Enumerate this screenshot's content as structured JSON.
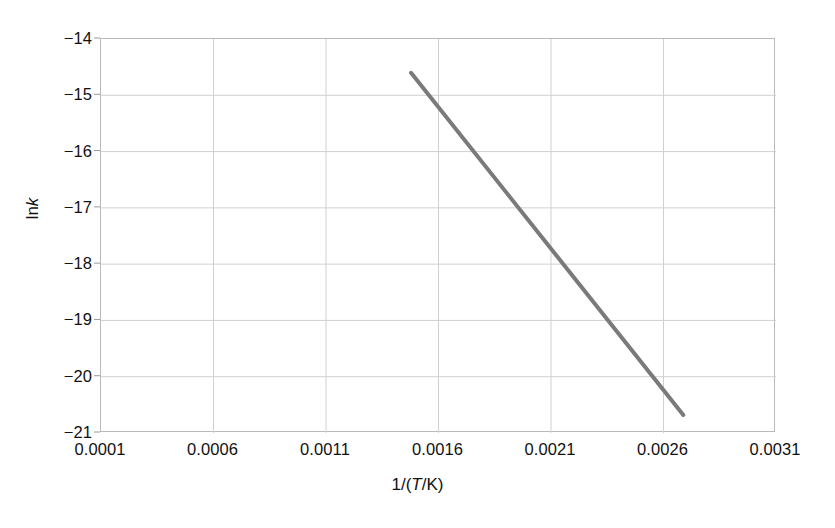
{
  "chart_data": {
    "type": "line",
    "title": "",
    "xlabel": "1/(T/K)",
    "ylabel": "lnk",
    "xlabel_parts": {
      "pre": "1/(",
      "italic": "T",
      "post": "/K)"
    },
    "ylabel_parts": {
      "pre": "ln",
      "italic": "k"
    },
    "xlim": [
      0.0001,
      0.0031
    ],
    "ylim": [
      -21,
      -14
    ],
    "xticks": [
      "0.0001",
      "0.0006",
      "0.0011",
      "0.0016",
      "0.0021",
      "0.0026",
      "0.0031"
    ],
    "xtick_values": [
      0.0001,
      0.0006,
      0.0011,
      0.0016,
      0.0021,
      0.0026,
      0.0031
    ],
    "yticks": [
      "−14",
      "−15",
      "−16",
      "−17",
      "−18",
      "−19",
      "−20",
      "−21"
    ],
    "ytick_values": [
      -14,
      -15,
      -16,
      -17,
      -18,
      -19,
      -20,
      -21
    ],
    "grid": true,
    "grid_color": "#d0d0d0",
    "legend": null,
    "series": [
      {
        "name": "Arrhenius fit",
        "color": "#7a7a7a",
        "line_width": 4,
        "x": [
          0.001478,
          0.002688
        ],
        "y": [
          -14.6,
          -20.68
        ]
      }
    ],
    "annotations": []
  },
  "figure": {
    "background": "#ffffff",
    "frame_color": "#b9b9b9",
    "text_color": "#111111"
  }
}
